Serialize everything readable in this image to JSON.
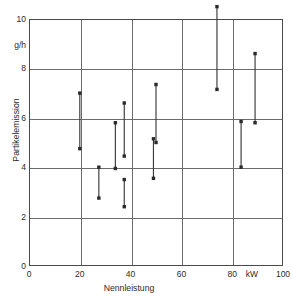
{
  "chart_data": {
    "type": "scatter",
    "title": "",
    "xlabel": "Nennleistung",
    "ylabel": "Partikelemission",
    "x_unit": "kW",
    "y_unit": "g/h",
    "xlim": [
      0,
      100
    ],
    "ylim": [
      0,
      10
    ],
    "x_ticks": [
      0,
      20,
      40,
      60,
      80,
      100
    ],
    "y_ticks": [
      0,
      2,
      4,
      6,
      8,
      10
    ],
    "x_tick_labels": [
      "0",
      "20",
      "40",
      "60",
      "80",
      "100"
    ],
    "y_tick_labels": [
      "0",
      "2",
      "4",
      "6",
      "8",
      "10"
    ],
    "grid": "both",
    "legend": "none",
    "series": [
      {
        "name": "Partikelemissionsbereich",
        "notation": "vertical range bars with end markers",
        "points": [
          {
            "x": 20.0,
            "y_low": 4.75,
            "y_high": 7.0
          },
          {
            "x": 27.5,
            "y_low": 2.75,
            "y_high": 4.0
          },
          {
            "x": 34.0,
            "y_low": 3.95,
            "y_high": 5.8
          },
          {
            "x": 37.5,
            "y_low": 4.45,
            "y_high": 6.6
          },
          {
            "x": 37.5,
            "y_low": 2.4,
            "y_high": 3.5
          },
          {
            "x": 49.0,
            "y_low": 3.55,
            "y_high": 5.15
          },
          {
            "x": 50.0,
            "y_low": 5.0,
            "y_high": 7.35
          },
          {
            "x": 74.0,
            "y_low": 7.15,
            "y_high": 10.5
          },
          {
            "x": 83.5,
            "y_low": 4.0,
            "y_high": 5.85
          },
          {
            "x": 89.0,
            "y_low": 5.8,
            "y_high": 8.6
          }
        ]
      }
    ]
  },
  "axes": {
    "y_unit_label": "g/h",
    "x_unit_label": "kW",
    "x_title": "Nennleistung",
    "y_title": "Partikelemission"
  },
  "colors": {
    "frame": "#4a4a4a",
    "grid": "#6b6b6b",
    "data": "#3a3a3a",
    "text": "#2b2b2b",
    "background": "#ffffff"
  }
}
